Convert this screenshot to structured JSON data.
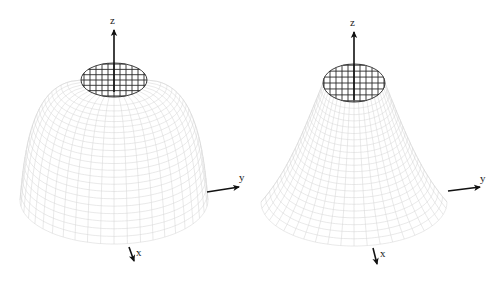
{
  "figure": {
    "width": 500,
    "height": 281,
    "background": "#ffffff",
    "mesh_color": "#d6d6d6",
    "cap_color": "#2a2a2a",
    "axis_color": "#111111"
  },
  "panels": [
    {
      "id": "left",
      "surface": "bell-dome",
      "profile": "rounded",
      "center_x": 114,
      "top_y": 80,
      "base_y": 200,
      "top_rx": 33,
      "top_ry": 17,
      "base_rx": 94,
      "base_ry": 44,
      "shoulder": 0.55,
      "radial_lines": 44,
      "rings": 22,
      "cap_rings": 4,
      "axes": {
        "z": {
          "label": "z",
          "from": [
            114,
            92
          ],
          "to": [
            114,
            30
          ],
          "label_pos": [
            110,
            24
          ]
        },
        "y": {
          "label": "y",
          "from": [
            207,
            192
          ],
          "to": [
            239,
            187
          ],
          "label_pos": [
            239,
            181
          ]
        },
        "x": {
          "label": "x",
          "from": [
            129,
            247
          ],
          "to": [
            134,
            261
          ],
          "label_pos": [
            136,
            256
          ]
        }
      }
    },
    {
      "id": "right",
      "surface": "bell-cone",
      "profile": "conical",
      "center_x": 354,
      "top_y": 83,
      "base_y": 202,
      "top_rx": 31,
      "top_ry": 19,
      "base_rx": 93,
      "base_ry": 44,
      "shoulder": 0.2,
      "radial_lines": 44,
      "rings": 22,
      "cap_rings": 4,
      "axes": {
        "z": {
          "label": "z",
          "from": [
            354,
            100
          ],
          "to": [
            354,
            32
          ],
          "label_pos": [
            350,
            26
          ]
        },
        "y": {
          "label": "y",
          "from": [
            448,
            191
          ],
          "to": [
            480,
            187
          ],
          "label_pos": [
            480,
            182
          ]
        },
        "x": {
          "label": "x",
          "from": [
            373,
            248
          ],
          "to": [
            377,
            264
          ],
          "label_pos": [
            380,
            257
          ]
        }
      }
    }
  ]
}
